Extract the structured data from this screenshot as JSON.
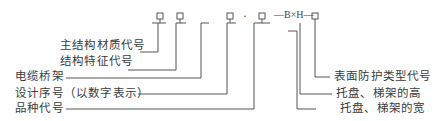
{
  "code_format": {
    "boxes_count": 6,
    "dot": "·",
    "dash_b_x_h_dash": "—B×H—"
  },
  "left_labels": [
    {
      "id": "main-material",
      "text": "主结构材质代号"
    },
    {
      "id": "structure-feature",
      "text": "结构特征代号"
    },
    {
      "id": "cable-tray",
      "text": "电缆桥架"
    },
    {
      "id": "design-serial",
      "text": "设计序号（以数字表示）"
    },
    {
      "id": "variety-code",
      "text": "品种代号"
    }
  ],
  "right_labels": [
    {
      "id": "surface-protection",
      "text": "表面防护类型代号"
    },
    {
      "id": "tray-height",
      "text": "托盘、梯架的高"
    },
    {
      "id": "tray-width",
      "text": "托盘、梯架的宽"
    }
  ]
}
